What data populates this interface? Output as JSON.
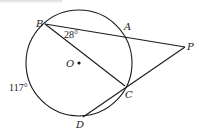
{
  "diagram": {
    "type": "geometry-circle-secants",
    "circle": {
      "center_label": "O",
      "cx": 79,
      "cy": 63,
      "r": 53
    },
    "points": {
      "B": {
        "label": "B",
        "x": 45,
        "y": 24
      },
      "A": {
        "label": "A",
        "x": 124,
        "y": 31
      },
      "P": {
        "label": "P",
        "x": 185,
        "y": 47
      },
      "C": {
        "label": "C",
        "x": 125,
        "y": 86
      },
      "D": {
        "label": "D",
        "x": 83,
        "y": 117
      },
      "O": {
        "label": "O",
        "x": 79,
        "y": 63
      }
    },
    "segments": [
      [
        "B",
        "P"
      ],
      [
        "B",
        "C"
      ],
      [
        "D",
        "P"
      ]
    ],
    "annotations": {
      "angle_B": "28°",
      "arc_BD": "117°"
    }
  }
}
